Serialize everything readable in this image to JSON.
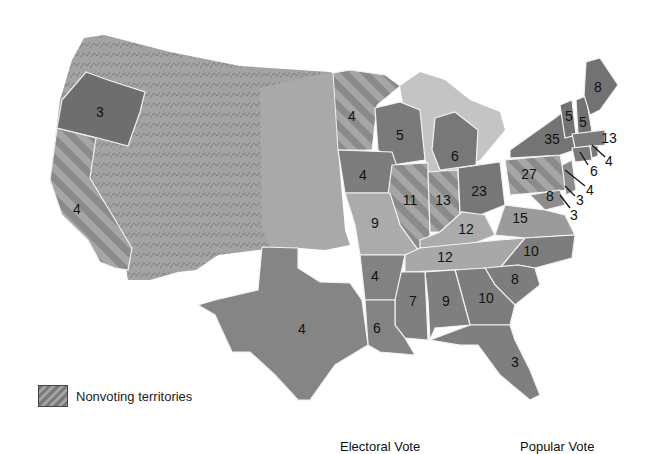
{
  "legend": {
    "nonvoting_label": "Nonvoting territories"
  },
  "footer": {
    "electoral_vote_label": "Electoral Vote",
    "popular_vote_label": "Popular Vote"
  },
  "colors": {
    "background": "#ffffff",
    "territory": "#a8a8a8",
    "state_dark": "#7c7c7c",
    "state_mid": "#939393",
    "state_light": "#b4b4b4",
    "lakes": "#c4c4c4",
    "border": "#f2f2f2"
  },
  "states": [
    {
      "name": "Oregon",
      "votes": "3"
    },
    {
      "name": "California",
      "votes": "4"
    },
    {
      "name": "Texas",
      "votes": "4"
    },
    {
      "name": "Minnesota",
      "votes": "4"
    },
    {
      "name": "Wisconsin",
      "votes": "5"
    },
    {
      "name": "Iowa",
      "votes": "4"
    },
    {
      "name": "Michigan",
      "votes": "6"
    },
    {
      "name": "Illinois",
      "votes": "11"
    },
    {
      "name": "Indiana",
      "votes": "13"
    },
    {
      "name": "Ohio",
      "votes": "23"
    },
    {
      "name": "Missouri",
      "votes": "9"
    },
    {
      "name": "Kentucky",
      "votes": "12"
    },
    {
      "name": "Tennessee",
      "votes": "12"
    },
    {
      "name": "Arkansas",
      "votes": "4"
    },
    {
      "name": "Louisiana",
      "votes": "6"
    },
    {
      "name": "Mississippi",
      "votes": "7"
    },
    {
      "name": "Alabama",
      "votes": "9"
    },
    {
      "name": "Georgia",
      "votes": "10"
    },
    {
      "name": "Florida",
      "votes": "3"
    },
    {
      "name": "South Carolina",
      "votes": "8"
    },
    {
      "name": "North Carolina",
      "votes": "10"
    },
    {
      "name": "Virginia",
      "votes": "15"
    },
    {
      "name": "Pennsylvania",
      "votes": "27"
    },
    {
      "name": "New York",
      "votes": "35"
    },
    {
      "name": "Vermont",
      "votes": "5"
    },
    {
      "name": "New Hampshire",
      "votes": "5"
    },
    {
      "name": "Maine",
      "votes": "8"
    },
    {
      "name": "Massachusetts",
      "votes": "13"
    },
    {
      "name": "Rhode Island",
      "votes": "4"
    },
    {
      "name": "Connecticut",
      "votes": "6"
    },
    {
      "name": "New Jersey",
      "votes": "4"
    },
    {
      "name": "Delaware",
      "votes": "3"
    },
    {
      "name": "Maryland",
      "votes": "8"
    },
    {
      "name": "District/Maryland callout",
      "votes": "3"
    }
  ]
}
